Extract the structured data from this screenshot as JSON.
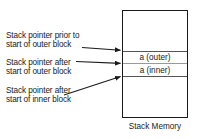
{
  "diagram": {
    "title": "Stack Memory",
    "annotations": [
      {
        "id": "ptr-prior-outer",
        "text": "Stack pointer prior to\nstart of outer block"
      },
      {
        "id": "ptr-after-outer",
        "text": "Stack pointer after\nstart of outer block"
      },
      {
        "id": "ptr-after-inner",
        "text": "Stack pointer after\nstart of inner block"
      }
    ],
    "stack": {
      "caption": "Stack Memory",
      "cells": [
        {
          "id": "cell-a-outer",
          "label": "a (outer)"
        },
        {
          "id": "cell-a-inner",
          "label": "a (inner)"
        }
      ]
    },
    "colors": {
      "ink": "#1a1a1a",
      "rule": "#555555",
      "rule_light": "#9a9a9a",
      "background": "#ffffff"
    }
  }
}
